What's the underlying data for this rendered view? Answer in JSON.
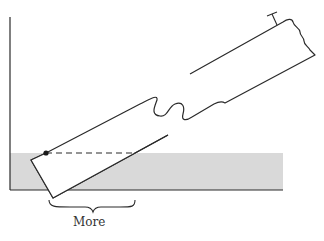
{
  "diagram": {
    "labels": {
      "more": "More"
    },
    "colors": {
      "stroke": "#2a2a2a",
      "shaded_region": "#d9d9d9",
      "background": "#ffffff"
    }
  }
}
